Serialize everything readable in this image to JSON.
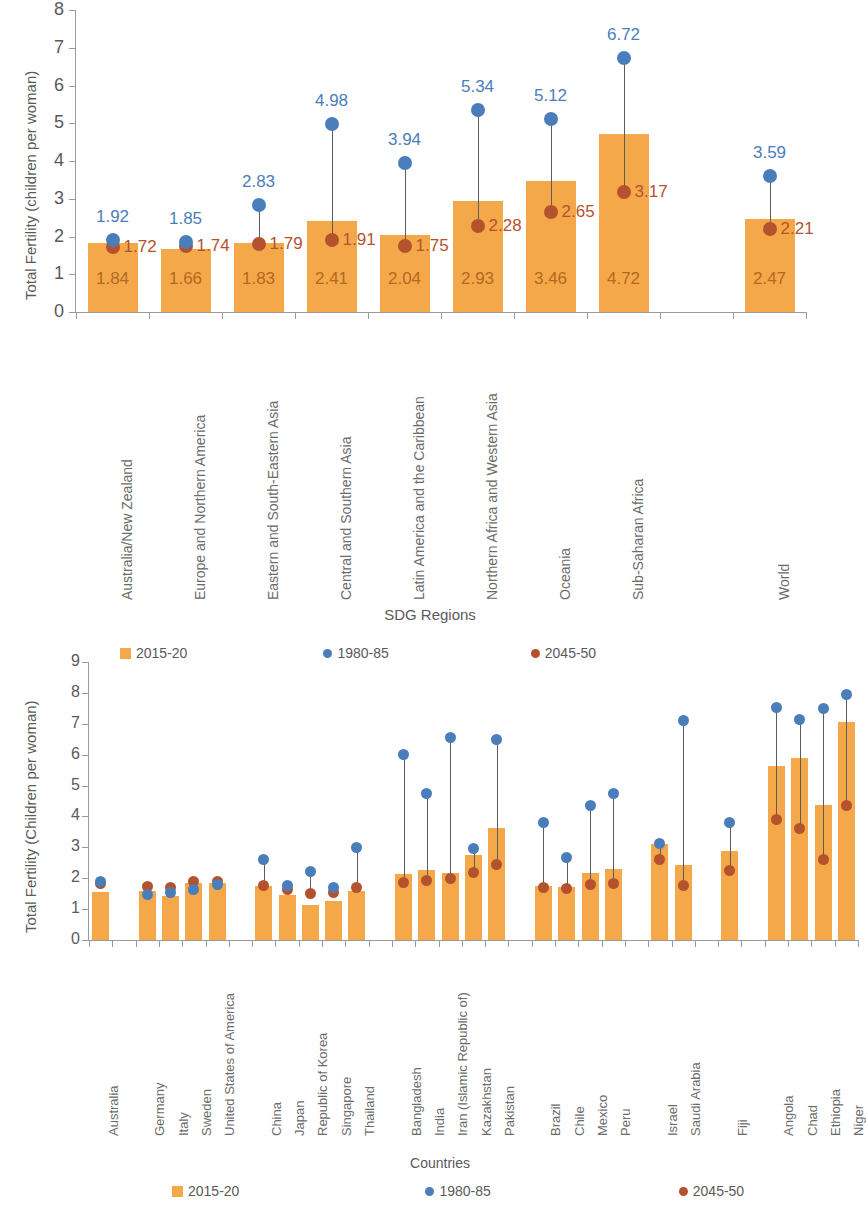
{
  "figure": {
    "legend_labels": [
      "2015-20",
      "1980-85",
      "2045-50"
    ],
    "colors": {
      "bar_2015_20": "#F5A84A",
      "dot_1980_85": "#4A7EBB",
      "dot_2045_50": "#B5522E",
      "axis": "#9a9a9a",
      "text": "#5a5a5a"
    }
  },
  "chart_data": [
    {
      "type": "bar",
      "id": "sdg-regions",
      "title": "",
      "xlabel": "SDG Regions",
      "ylabel": "Total Fertility  (children per woman)",
      "ylim": [
        0,
        8
      ],
      "yticks": [
        0,
        1,
        2,
        3,
        4,
        5,
        6,
        7,
        8
      ],
      "grid": false,
      "legend_position": "none",
      "categories": [
        "Australia/New Zealand",
        "Europe and Northern America",
        "Eastern and South-Eastern Asia",
        "Central and Southern Asia",
        "Latin America and the Caribbean",
        "Northern Africa and Western Asia",
        "Oceania",
        "Sub-Saharan Africa",
        "",
        "World"
      ],
      "series": [
        {
          "name": "2015-20",
          "type": "bar",
          "values": [
            1.84,
            1.66,
            1.83,
            2.41,
            2.04,
            2.93,
            3.46,
            4.72,
            null,
            2.47
          ]
        },
        {
          "name": "1980-85",
          "type": "scatter",
          "values": [
            1.92,
            1.85,
            2.83,
            4.98,
            3.94,
            5.34,
            5.12,
            6.72,
            null,
            3.59
          ]
        },
        {
          "name": "2045-50",
          "type": "scatter",
          "values": [
            1.72,
            1.74,
            1.79,
            1.91,
            1.75,
            2.28,
            2.65,
            3.17,
            null,
            2.21
          ]
        }
      ]
    },
    {
      "type": "bar",
      "id": "countries",
      "title": "",
      "xlabel": "Countries",
      "ylabel": "Total Fertility (Children per woman)",
      "ylim": [
        0,
        9
      ],
      "yticks": [
        0,
        1,
        2,
        3,
        4,
        5,
        6,
        7,
        8,
        9
      ],
      "grid": false,
      "legend_position": "top and bottom",
      "categories": [
        "Australia",
        "",
        "Germany",
        "Italy",
        "Sweden",
        "United States of America",
        "",
        "China",
        "Japan",
        "Republic of Korea",
        "Singapore",
        "Thailand",
        "",
        "Bangladesh",
        "India",
        "Iran (Islamic Republic of)",
        "Kazakhstan",
        "Pakistan",
        "",
        "Brazil",
        "Chile",
        "Mexico",
        "Peru",
        "",
        "Israel",
        "Saudi Arabia",
        "",
        "Fiji",
        "",
        "Angola",
        "Chad",
        "Ethiopia",
        "Niger"
      ],
      "series": [
        {
          "name": "2015-20",
          "type": "bar",
          "values": [
            1.56,
            null,
            1.59,
            1.43,
            1.85,
            1.83,
            null,
            1.75,
            1.46,
            1.14,
            1.26,
            1.58,
            null,
            2.13,
            2.28,
            2.17,
            2.76,
            3.62,
            null,
            1.74,
            1.72,
            2.18,
            2.3,
            null,
            3.11,
            2.43,
            null,
            2.87,
            null,
            5.62,
            5.88,
            4.37,
            7.05
          ]
        },
        {
          "name": "1980-85",
          "type": "scatter",
          "values": [
            1.9,
            null,
            1.46,
            1.55,
            1.63,
            1.8,
            null,
            2.61,
            1.77,
            2.23,
            1.71,
            3.0,
            null,
            6.02,
            4.73,
            6.54,
            2.97,
            6.49,
            null,
            3.8,
            2.67,
            4.35,
            4.75,
            null,
            3.14,
            7.09,
            null,
            3.82,
            null,
            7.53,
            7.15,
            7.5,
            7.96
          ]
        },
        {
          "name": "2045-50",
          "type": "scatter",
          "values": [
            1.82,
            null,
            1.74,
            1.71,
            1.88,
            1.88,
            null,
            1.77,
            1.62,
            1.51,
            1.55,
            1.71,
            null,
            1.87,
            1.92,
            1.98,
            2.19,
            2.43,
            null,
            1.7,
            1.67,
            1.81,
            1.84,
            null,
            2.59,
            1.78,
            null,
            2.26,
            null,
            3.91,
            3.62,
            2.6,
            4.37
          ]
        }
      ]
    }
  ],
  "top_chart": {
    "ylabel": "Total Fertility  (children per woman)",
    "xlabel": "SDG Regions",
    "yticks": [
      "8",
      "7",
      "6",
      "5",
      "4",
      "3",
      "2",
      "1",
      "0"
    ],
    "bars": [
      {
        "label": "Australia/New Zealand",
        "v2015": "1.84",
        "v1980": "1.92",
        "v2045": "1.72"
      },
      {
        "label": "Europe and Northern America",
        "v2015": "1.66",
        "v1980": "1.85",
        "v2045": "1.74"
      },
      {
        "label": "Eastern and South-Eastern Asia",
        "v2015": "1.83",
        "v1980": "2.83",
        "v2045": "1.79"
      },
      {
        "label": "Central and Southern Asia",
        "v2015": "2.41",
        "v1980": "4.98",
        "v2045": "1.91"
      },
      {
        "label": "Latin America and the Caribbean",
        "v2015": "2.04",
        "v1980": "3.94",
        "v2045": "1.75"
      },
      {
        "label": "Northern Africa and Western Asia",
        "v2015": "2.93",
        "v1980": "5.34",
        "v2045": "2.28"
      },
      {
        "label": "Oceania",
        "v2015": "3.46",
        "v1980": "5.12",
        "v2045": "2.65"
      },
      {
        "label": "Sub-Saharan Africa",
        "v2015": "4.72",
        "v1980": "6.72",
        "v2045": "3.17"
      },
      {
        "label": "World",
        "v2015": "2.47",
        "v1980": "3.59",
        "v2045": "2.21"
      }
    ]
  },
  "bottom_chart": {
    "ylabel": "Total Fertility (Children per woman)",
    "xlabel": "Countries",
    "yticks": [
      "9",
      "8",
      "7",
      "6",
      "5",
      "4",
      "3",
      "2",
      "1",
      "0"
    ],
    "countries": [
      "Australia",
      "Germany",
      "Italy",
      "Sweden",
      "United States of America",
      "China",
      "Japan",
      "Republic of Korea",
      "Singapore",
      "Thailand",
      "Bangladesh",
      "India",
      "Iran (Islamic Republic of)",
      "Kazakhstan",
      "Pakistan",
      "Brazil",
      "Chile",
      "Mexico",
      "Peru",
      "Israel",
      "Saudi Arabia",
      "Fiji",
      "Angola",
      "Chad",
      "Ethiopia",
      "Niger"
    ],
    "legend_top": [
      "2015-20",
      "1980-85",
      "2045-50"
    ],
    "legend_bottom": [
      "2015-20",
      "1980-85",
      "2045-50"
    ]
  }
}
